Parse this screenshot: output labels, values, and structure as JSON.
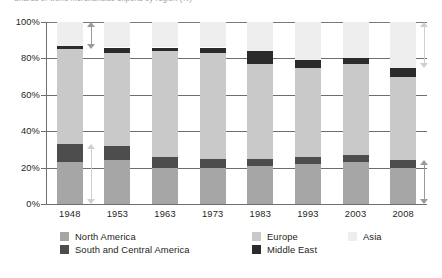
{
  "chart_data": {
    "type": "bar",
    "stacked": true,
    "title": "Shares of world merchandise exports by region (%)",
    "xlabel": "",
    "ylabel": "",
    "ylim": [
      0,
      100
    ],
    "grid": true,
    "legend_position": "bottom",
    "categories": [
      "1948",
      "1953",
      "1963",
      "1973",
      "1983",
      "1993",
      "2003",
      "2008"
    ],
    "ytick_labels": [
      "0%",
      "20%",
      "40%",
      "60%",
      "80%",
      "100%"
    ],
    "ytick_values": [
      0,
      20,
      40,
      60,
      80,
      100
    ],
    "series": [
      {
        "name": "North America",
        "color": "#a6a6a6",
        "values": [
          23.0,
          24.0,
          20.0,
          20.0,
          21.0,
          22.0,
          23.0,
          20.0
        ]
      },
      {
        "name": "South and Central America",
        "color": "#4d4d4d",
        "values": [
          10.0,
          8.0,
          6.0,
          5.0,
          4.0,
          4.0,
          4.0,
          4.0
        ]
      },
      {
        "name": "Europe",
        "color": "#c9c9c9",
        "values": [
          52.0,
          51.0,
          58.0,
          58.0,
          52.0,
          49.0,
          50.0,
          46.0
        ]
      },
      {
        "name": "Middle East",
        "color": "#2b2b2b",
        "values": [
          2.0,
          3.0,
          2.0,
          3.0,
          7.0,
          4.0,
          3.0,
          5.0
        ]
      },
      {
        "name": "Asia",
        "color": "#eeeeee",
        "values": [
          13.0,
          14.0,
          14.0,
          14.0,
          16.0,
          21.0,
          20.0,
          25.0
        ]
      }
    ],
    "annotations": [
      {
        "name": "asia-share-1948-arrow",
        "category": "1948",
        "from": 85.0,
        "to": 100.0,
        "color": "#9a9a9a"
      },
      {
        "name": "americas-share-1948-arrow",
        "category": "1948",
        "from": 0.0,
        "to": 33.0,
        "color": "#cfcfcf"
      },
      {
        "name": "asia-share-2008-arrow",
        "category": "2008",
        "from": 75.0,
        "to": 100.0,
        "color": "#cfcfcf"
      },
      {
        "name": "americas-share-2008-arrow",
        "category": "2008",
        "from": 0.0,
        "to": 24.0,
        "color": "#9a9a9a"
      }
    ]
  },
  "legend": {
    "items": [
      {
        "label": "North America",
        "color": "#a6a6a6"
      },
      {
        "label": "South and Central America",
        "color": "#4d4d4d"
      },
      {
        "label": "Europe",
        "color": "#c9c9c9"
      },
      {
        "label": "Middle East",
        "color": "#2b2b2b"
      },
      {
        "label": "Asia",
        "color": "#eeeeee"
      }
    ]
  },
  "colors": {
    "gridline": "#6f6f6f",
    "text": "#231f20",
    "background": "#ffffff"
  }
}
